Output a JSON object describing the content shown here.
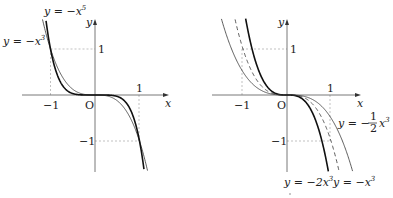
{
  "figure": {
    "left_panel": {
      "title": "Graphs of y = -x^3 and y = -x^5",
      "axis_labels": {
        "x": "x",
        "y": "y",
        "origin": "O"
      },
      "ticks": {
        "x_neg": "−1",
        "x_pos": "1",
        "y_pos": "1",
        "y_neg": "−1"
      },
      "curves": [
        {
          "name": "y = -x^3",
          "label_main": "y = −x",
          "label_exp": "3",
          "style": "thin",
          "k": -1,
          "n": 3
        },
        {
          "name": "y = -x^5",
          "label_main": "y = −x",
          "label_exp": "5",
          "style": "thick",
          "k": -1,
          "n": 5
        }
      ]
    },
    "right_panel": {
      "title": "Graphs of y = -2x^3, y = -x^3, y = -1/2 x^3",
      "axis_labels": {
        "x": "x",
        "y": "y",
        "origin": "O"
      },
      "ticks": {
        "x_neg": "−1",
        "x_pos": "1",
        "y_pos": "1",
        "y_neg": "−1"
      },
      "curves": [
        {
          "name": "y = -2x^3",
          "label_main": "y = −2x",
          "label_exp": "3",
          "style": "thick",
          "k": -2,
          "n": 3
        },
        {
          "name": "y = -x^3",
          "label_main": "y = −x",
          "label_exp": "3",
          "style": "dashed",
          "k": -1,
          "n": 3
        },
        {
          "name": "y = -1/2 x^3",
          "label_pre": "y = −",
          "label_num": "1",
          "label_den": "2",
          "label_var": "x",
          "label_exp": "3",
          "style": "thin",
          "k": -0.5,
          "n": 3
        }
      ]
    }
  }
}
